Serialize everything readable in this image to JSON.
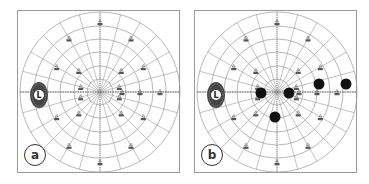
{
  "figure": {
    "panels": [
      {
        "id": "a",
        "label": "a",
        "blind_spot_label": "L",
        "scotomas": []
      },
      {
        "id": "b",
        "label": "b",
        "blind_spot_label": "L",
        "scotomas": [
          {
            "x": 66,
            "y": 82
          },
          {
            "x": 94,
            "y": 82
          },
          {
            "x": 124,
            "y": 73
          },
          {
            "x": 151,
            "y": 73
          },
          {
            "x": 80,
            "y": 106
          }
        ]
      }
    ],
    "colors": {
      "grid": "#9a9a9a",
      "scotoma": "#111111",
      "blind_spot": "#444444",
      "border": "#9a9a9a"
    }
  }
}
